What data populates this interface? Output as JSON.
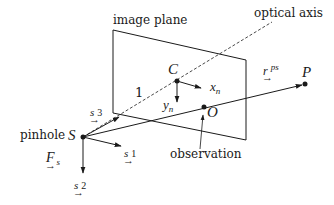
{
  "diagram": {
    "labels": {
      "image_plane": "image plane",
      "optical_axis": "optical axis",
      "pinhole": "pinhole",
      "observation": "observation",
      "focal_length": "1",
      "center_point": "C",
      "pinhole_point": "S",
      "observation_point": "O",
      "world_point": "P",
      "x_axis_base": "x",
      "x_axis_sub": "n",
      "y_axis_base": "y",
      "y_axis_sub": "n",
      "ray_base": "r",
      "ray_sup": "ps",
      "frame_base": "F",
      "frame_sub": "s",
      "s1_base": "s",
      "s1_idx": "1",
      "s2_base": "s",
      "s2_idx": "2",
      "s3_base": "s",
      "s3_idx": "3",
      "vec_arrow": "→"
    },
    "colors": {
      "stroke": "#1a1a1a",
      "background": "#ffffff"
    },
    "points": {
      "S": [
        83,
        137
      ],
      "C": [
        177,
        81
      ],
      "O": [
        204,
        107
      ],
      "P": [
        305,
        84
      ]
    }
  }
}
